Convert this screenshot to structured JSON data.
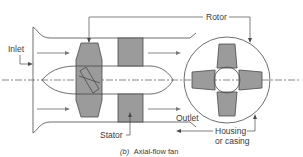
{
  "diagram": {
    "title": "Axial-flow fan",
    "caption_prefix": "(b)",
    "caption_text": "Axial-flow fan",
    "labels": {
      "rotor": "Rotor",
      "inlet": "Inlet",
      "stator": "Stator",
      "outlet": "Outlet",
      "housing_line1": "Housing",
      "housing_line2": "or casing"
    },
    "components": [
      {
        "id": "housing",
        "name": "Housing or casing",
        "shape": "flared duct"
      },
      {
        "id": "hub",
        "name": "Hub",
        "shape": "bullet nose body"
      },
      {
        "id": "rotor",
        "name": "Rotor",
        "shape": "trapezoidal blades"
      },
      {
        "id": "stator",
        "name": "Stator",
        "shape": "rectangular vanes"
      },
      {
        "id": "end-view",
        "name": "End view of rotor in housing",
        "shape": "circle with four blades"
      }
    ],
    "flow_arrows": 6,
    "colors": {
      "part_fill": "#9b9b9b",
      "line": "#4a4a4a",
      "arrow": "#7a7a7a",
      "background": "#ffffff"
    }
  }
}
